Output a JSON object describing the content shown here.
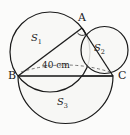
{
  "figure": {
    "type": "geometry-diagram",
    "background_color": "#fbfbfa",
    "stroke_color": "#1a1a1a",
    "fill_color": "#f7f7f5",
    "vertices": [
      {
        "id": "A",
        "label": "A",
        "x": 82,
        "y": 28
      },
      {
        "id": "B",
        "label": "B",
        "x": 18,
        "y": 76
      },
      {
        "id": "C",
        "label": "C",
        "x": 113,
        "y": 76
      }
    ],
    "regions": [
      {
        "id": "S1",
        "label": "S",
        "subscript": "1",
        "x": 31,
        "y": 33
      },
      {
        "id": "S2",
        "label": "S",
        "subscript": "2",
        "x": 94,
        "y": 43
      },
      {
        "id": "S3",
        "label": "S",
        "subscript": "3",
        "x": 57,
        "y": 97
      }
    ],
    "measurements": [
      {
        "id": "bc-length",
        "text": "40 cm",
        "value": 40,
        "unit": "cm",
        "segment": "BC",
        "style": "dashed"
      }
    ],
    "markers": [
      {
        "id": "right-angle-A",
        "type": "right-angle-arc",
        "at_vertex": "A"
      }
    ],
    "circles": [
      {
        "id": "circle-S1",
        "diameter_segment": "AB",
        "cx": 50,
        "cy": 52,
        "r": 40
      },
      {
        "id": "circle-S2",
        "diameter_segment": "AC",
        "cx": 104.5,
        "cy": 50,
        "r": 23.5
      },
      {
        "id": "semicircle-S3",
        "diameter_segment": "BC",
        "cx": 65.5,
        "cy": 76,
        "r": 47.5
      }
    ]
  }
}
